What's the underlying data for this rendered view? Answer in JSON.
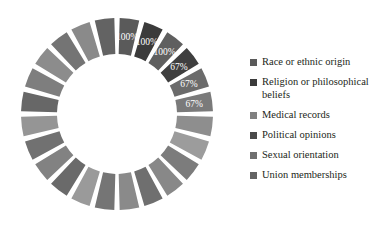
{
  "chart_data": {
    "type": "pie",
    "variant": "donut",
    "title": "",
    "subtitle": "",
    "xlabel": "",
    "ylabel": "",
    "grid": false,
    "legend_position": "right",
    "start_angle_deg": 0,
    "direction": "clockwise",
    "total_segments": 24,
    "equal_segments": true,
    "categories": [
      "Race or ethnic origin",
      "Religion or philosophical beliefs",
      "Medical records",
      "Political opinions",
      "Sexual orientation",
      "Union memberships"
    ],
    "values": [
      100,
      100,
      100,
      67,
      67,
      67
    ],
    "value_labels": [
      "100%",
      "100%",
      "100%",
      "67%",
      "67%",
      "67%"
    ],
    "series": [
      {
        "name": "Percentage",
        "values": [
          100,
          100,
          100,
          67,
          67,
          67
        ]
      }
    ],
    "labeled_slice_colors": [
      "#5a5a5a",
      "#3b3b3b",
      "#5f5f5f",
      "#3f3f3f",
      "#6b6b6b",
      "#7a7a7a"
    ],
    "unlabeled_slice_colors": [
      "#8e8e8e",
      "#9c9c9c",
      "#7c7c7c",
      "#888888",
      "#6f6f6f",
      "#8a8a8a",
      "#757575",
      "#9a9a9a",
      "#6a6a6a",
      "#828282",
      "#717171",
      "#959595",
      "#676767",
      "#7e7e7e",
      "#8c8c8c",
      "#747474",
      "#8a8a8a",
      "#636363"
    ],
    "geometry": {
      "center_x": 117,
      "center_y": 114,
      "outer_radius": 96,
      "inner_radius": 60,
      "gap_deg": 3.2
    }
  },
  "legend": {
    "items": [
      {
        "label": "Race or ethnic origin",
        "color": "#5a5a5a"
      },
      {
        "label": "Religion or philosophical beliefs",
        "color": "#3b3b3b"
      },
      {
        "label": "Medical records",
        "color": "#808080"
      },
      {
        "label": "Political opinions",
        "color": "#4a4a4a"
      },
      {
        "label": "Sexual orientation",
        "color": "#6f6f6f"
      },
      {
        "label": "Union memberships",
        "color": "#636363"
      }
    ]
  }
}
